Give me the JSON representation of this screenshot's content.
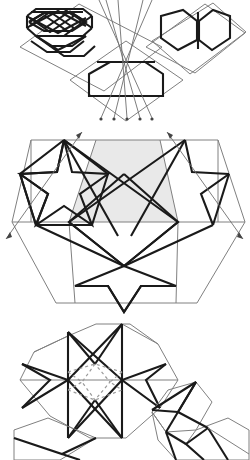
{
  "figure": {
    "description": "Three-panel line construction: hexagonal tile panels with interlaced polygons, a hexagon with star motifs and shaded core, and an eight-pointed star rosette.",
    "background_color": "#ffffff",
    "palette": {
      "construction_line": "#808080",
      "pattern_line": "#1a1a1a",
      "shaded_region": "#e9e9e9",
      "hidden_line": "#9a9a9a",
      "arrow_tip": "#444444"
    },
    "canvas": {
      "width": 249,
      "height": 459
    }
  },
  "panels": [
    {
      "id": "top",
      "name": "hexagon-tiles-with-rays",
      "label": "Top panel",
      "content": "Three rhombic tiles carrying interlaced hexagon motifs, crossed by converging construction rays terminating in arrow tips.",
      "tile_count": 3,
      "ray_count": 4,
      "y_offset": 0
    },
    {
      "id": "middle",
      "name": "hexagon-star-shaded-core",
      "label": "Middle panel",
      "content": "Large hexagonal frame containing two five-point star motifs, a shaded hexagonal core region and a lower chevron, crossed by two diagonal construction axes with arrowheads at both ends.",
      "star_count": 2,
      "axis_count": 2,
      "shaded": true,
      "y_offset": 126
    },
    {
      "id": "bottom",
      "name": "eight-point-star-rosette",
      "label": "Bottom panel",
      "content": "Decagonal outline enclosing an eight-pointed star built from bold rays, with dashed hidden construction lines at the centre, plus partial adjoining tiles at lower right.",
      "star_points": 8,
      "hidden_lines": true,
      "y_offset": 320
    }
  ],
  "legend": {
    "construction_line_label": "construction line",
    "pattern_line_label": "pattern line",
    "hidden_line_label": "hidden line",
    "shaded_label": "shaded region"
  }
}
